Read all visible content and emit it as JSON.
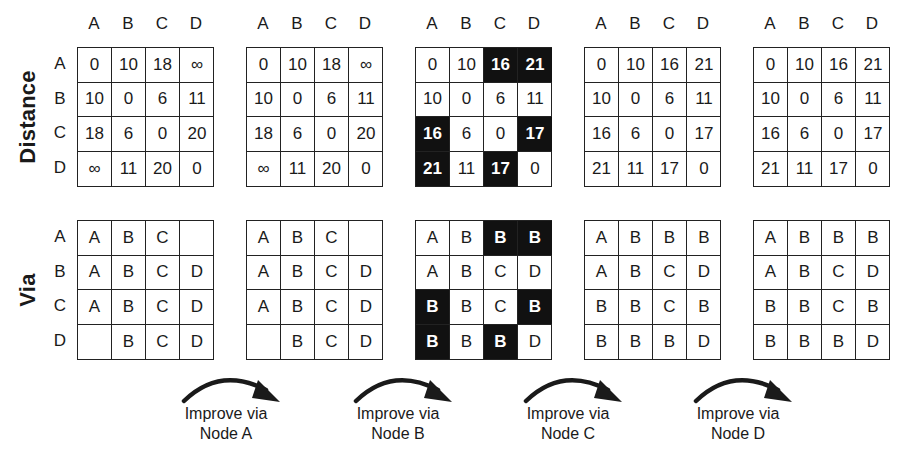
{
  "columns": [
    "A",
    "B",
    "C",
    "D"
  ],
  "rows": [
    "A",
    "B",
    "C",
    "D"
  ],
  "section_labels": {
    "distance": "Distance",
    "via": "Via"
  },
  "colors": {
    "highlight_bg": "#111111",
    "highlight_fg": "#ffffff",
    "grid_line": "#222222"
  },
  "stages": [
    {
      "distance": [
        [
          "0",
          "10",
          "18",
          "∞"
        ],
        [
          "10",
          "0",
          "6",
          "11"
        ],
        [
          "18",
          "6",
          "0",
          "20"
        ],
        [
          "∞",
          "11",
          "20",
          "0"
        ]
      ],
      "distance_highlight": [
        [
          0,
          0,
          0,
          0
        ],
        [
          0,
          0,
          0,
          0
        ],
        [
          0,
          0,
          0,
          0
        ],
        [
          0,
          0,
          0,
          0
        ]
      ],
      "via": [
        [
          "A",
          "B",
          "C",
          ""
        ],
        [
          "A",
          "B",
          "C",
          "D"
        ],
        [
          "A",
          "B",
          "C",
          "D"
        ],
        [
          "",
          "B",
          "C",
          "D"
        ]
      ],
      "via_highlight": [
        [
          0,
          0,
          0,
          0
        ],
        [
          0,
          0,
          0,
          0
        ],
        [
          0,
          0,
          0,
          0
        ],
        [
          0,
          0,
          0,
          0
        ]
      ]
    },
    {
      "distance": [
        [
          "0",
          "10",
          "18",
          "∞"
        ],
        [
          "10",
          "0",
          "6",
          "11"
        ],
        [
          "18",
          "6",
          "0",
          "20"
        ],
        [
          "∞",
          "11",
          "20",
          "0"
        ]
      ],
      "distance_highlight": [
        [
          0,
          0,
          0,
          0
        ],
        [
          0,
          0,
          0,
          0
        ],
        [
          0,
          0,
          0,
          0
        ],
        [
          0,
          0,
          0,
          0
        ]
      ],
      "via": [
        [
          "A",
          "B",
          "C",
          ""
        ],
        [
          "A",
          "B",
          "C",
          "D"
        ],
        [
          "A",
          "B",
          "C",
          "D"
        ],
        [
          "",
          "B",
          "C",
          "D"
        ]
      ],
      "via_highlight": [
        [
          0,
          0,
          0,
          0
        ],
        [
          0,
          0,
          0,
          0
        ],
        [
          0,
          0,
          0,
          0
        ],
        [
          0,
          0,
          0,
          0
        ]
      ]
    },
    {
      "distance": [
        [
          "0",
          "10",
          "16",
          "21"
        ],
        [
          "10",
          "0",
          "6",
          "11"
        ],
        [
          "16",
          "6",
          "0",
          "17"
        ],
        [
          "21",
          "11",
          "17",
          "0"
        ]
      ],
      "distance_highlight": [
        [
          0,
          0,
          1,
          1
        ],
        [
          0,
          0,
          0,
          0
        ],
        [
          1,
          0,
          0,
          1
        ],
        [
          1,
          0,
          1,
          0
        ]
      ],
      "via": [
        [
          "A",
          "B",
          "B",
          "B"
        ],
        [
          "A",
          "B",
          "C",
          "D"
        ],
        [
          "B",
          "B",
          "C",
          "B"
        ],
        [
          "B",
          "B",
          "B",
          "D"
        ]
      ],
      "via_highlight": [
        [
          0,
          0,
          1,
          1
        ],
        [
          0,
          0,
          0,
          0
        ],
        [
          1,
          0,
          0,
          1
        ],
        [
          1,
          0,
          1,
          0
        ]
      ]
    },
    {
      "distance": [
        [
          "0",
          "10",
          "16",
          "21"
        ],
        [
          "10",
          "0",
          "6",
          "11"
        ],
        [
          "16",
          "6",
          "0",
          "17"
        ],
        [
          "21",
          "11",
          "17",
          "0"
        ]
      ],
      "distance_highlight": [
        [
          0,
          0,
          0,
          0
        ],
        [
          0,
          0,
          0,
          0
        ],
        [
          0,
          0,
          0,
          0
        ],
        [
          0,
          0,
          0,
          0
        ]
      ],
      "via": [
        [
          "A",
          "B",
          "B",
          "B"
        ],
        [
          "A",
          "B",
          "C",
          "D"
        ],
        [
          "B",
          "B",
          "C",
          "B"
        ],
        [
          "B",
          "B",
          "B",
          "D"
        ]
      ],
      "via_highlight": [
        [
          0,
          0,
          0,
          0
        ],
        [
          0,
          0,
          0,
          0
        ],
        [
          0,
          0,
          0,
          0
        ],
        [
          0,
          0,
          0,
          0
        ]
      ]
    },
    {
      "distance": [
        [
          "0",
          "10",
          "16",
          "21"
        ],
        [
          "10",
          "0",
          "6",
          "11"
        ],
        [
          "16",
          "6",
          "0",
          "17"
        ],
        [
          "21",
          "11",
          "17",
          "0"
        ]
      ],
      "distance_highlight": [
        [
          0,
          0,
          0,
          0
        ],
        [
          0,
          0,
          0,
          0
        ],
        [
          0,
          0,
          0,
          0
        ],
        [
          0,
          0,
          0,
          0
        ]
      ],
      "via": [
        [
          "A",
          "B",
          "B",
          "B"
        ],
        [
          "A",
          "B",
          "C",
          "D"
        ],
        [
          "B",
          "B",
          "C",
          "B"
        ],
        [
          "B",
          "B",
          "B",
          "D"
        ]
      ],
      "via_highlight": [
        [
          0,
          0,
          0,
          0
        ],
        [
          0,
          0,
          0,
          0
        ],
        [
          0,
          0,
          0,
          0
        ],
        [
          0,
          0,
          0,
          0
        ]
      ]
    }
  ],
  "steps": [
    {
      "line1": "Improve via",
      "line2": "Node A"
    },
    {
      "line1": "Improve via",
      "line2": "Node B"
    },
    {
      "line1": "Improve via",
      "line2": "Node C"
    },
    {
      "line1": "Improve via",
      "line2": "Node D"
    }
  ]
}
